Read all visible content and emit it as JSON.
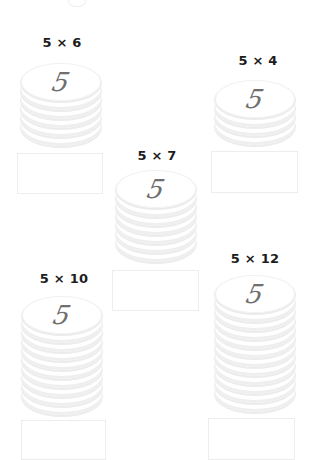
{
  "worksheet": {
    "topic": "Multiplication by 5 with coin stacks",
    "coin_value": "5",
    "stacks": [
      {
        "label": "5 × 6",
        "coins": 6,
        "answer": ""
      },
      {
        "label": "5 × 4",
        "coins": 4,
        "answer": ""
      },
      {
        "label": "5 × 7",
        "coins": 7,
        "answer": ""
      },
      {
        "label": "5 × 10",
        "coins": 10,
        "answer": ""
      },
      {
        "label": "5 × 12",
        "coins": 12,
        "answer": ""
      }
    ]
  },
  "colors": {
    "label": "#1c1c1c",
    "digit": "#6f6f6f",
    "coin_rim": "#ececec",
    "box_border": "#ededed"
  }
}
